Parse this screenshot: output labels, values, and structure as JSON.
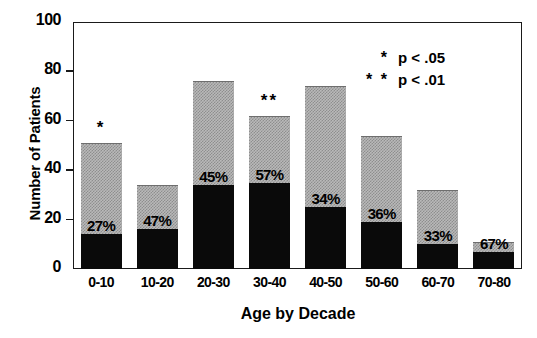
{
  "chart_data": {
    "type": "bar",
    "subtype": "stacked",
    "title": "",
    "xlabel": "Age by Decade",
    "ylabel": "Number of Patients",
    "categories": [
      "0-10",
      "10-20",
      "20-30",
      "30-40",
      "40-50",
      "50-60",
      "60-70",
      "70-80"
    ],
    "ylim": [
      0,
      100
    ],
    "yticks": [
      "0",
      "20",
      "40",
      "60",
      "80",
      "100"
    ],
    "grid": false,
    "legend_position": "top-right",
    "series": [
      {
        "name": "Filled (black) subgroup",
        "color": "#0a0a0a",
        "values": [
          14,
          16,
          34,
          35,
          25,
          19,
          10,
          7
        ]
      },
      {
        "name": "Remainder (stippled gray)",
        "color": "#b9b9b9",
        "values": [
          37,
          18,
          42,
          27,
          49,
          35,
          22,
          4
        ]
      }
    ],
    "totals": [
      51,
      34,
      76,
      62,
      74,
      54,
      32,
      11
    ],
    "percent_labels": [
      "27%",
      "47%",
      "45%",
      "57%",
      "34%",
      "36%",
      "33%",
      "67%"
    ],
    "significance_markers": [
      "*",
      "",
      "",
      "**",
      "",
      "",
      "",
      ""
    ],
    "annotations": [
      {
        "text": "* p < .05"
      },
      {
        "text": "** p < .01"
      }
    ]
  },
  "legend": {
    "rows": [
      {
        "stars": "*",
        "ptext": "p < .05"
      },
      {
        "stars": "* *",
        "ptext": "p < .01"
      }
    ]
  },
  "axis": {
    "y_title": "Number of Patients",
    "x_title": "Age by Decade"
  }
}
